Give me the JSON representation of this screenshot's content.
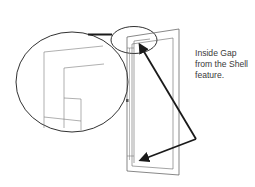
{
  "diagram": {
    "callout": {
      "lines": [
        "Inside Gap",
        "from the Shell",
        "feature."
      ]
    },
    "elements": {
      "detail_circle": "magnified-detail-view",
      "highlight_ellipse": "highlighted-corner-region",
      "shell_outline": "shell-body-outline",
      "arrows": [
        "arrow-to-top-gap",
        "arrow-to-bottom-gap"
      ]
    },
    "colors": {
      "stroke": "#1a1a1a",
      "thin_line": "#6e6e6e",
      "text": "#3a3a3a",
      "background": "#ffffff"
    }
  }
}
